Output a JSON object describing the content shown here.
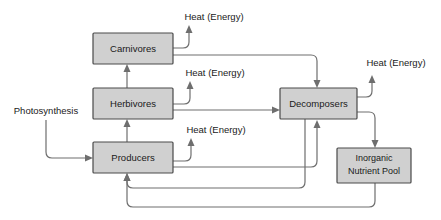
{
  "diagram": {
    "background_color": "#ffffff",
    "box_fill_color": "#d0d0d0",
    "box_border_color": "#4a4a4a",
    "line_color": "#6e6e6e",
    "text_color": "#1a1a1a",
    "nodes": [
      {
        "id": "carnivores",
        "label": "Carnivores",
        "x": 93,
        "y": 33,
        "w": 80,
        "h": 31
      },
      {
        "id": "herbivores",
        "label": "Herbivores",
        "x": 93,
        "y": 88,
        "w": 80,
        "h": 31
      },
      {
        "id": "producers",
        "label": "Producers",
        "x": 93,
        "y": 142,
        "w": 80,
        "h": 31
      },
      {
        "id": "decomposers",
        "label": "Decomposers",
        "x": 280,
        "y": 88,
        "w": 77,
        "h": 31
      },
      {
        "id": "inorganic_nutrient_pool",
        "label_line1": "Inorganic",
        "label_line2": "Nutrient Pool",
        "x": 337,
        "y": 148,
        "w": 74,
        "h": 35
      }
    ],
    "free_labels": [
      {
        "id": "photosynthesis",
        "text": "Photosynthesis",
        "x": 46,
        "y": 111
      },
      {
        "id": "heat-carnivores",
        "text": "Heat (Energy)",
        "x": 214,
        "y": 17
      },
      {
        "id": "heat-herbivores",
        "text": "Heat (Energy)",
        "x": 215,
        "y": 73
      },
      {
        "id": "heat-producers",
        "text": "Heat (Energy)",
        "x": 216,
        "y": 130
      },
      {
        "id": "heat-decomposers",
        "text": "Heat (Energy)",
        "x": 396,
        "y": 63
      }
    ],
    "flows": [
      {
        "id": "photosynthesis-to-producers",
        "from": "photosynthesis",
        "to": "producers"
      },
      {
        "id": "producers-to-herbivores",
        "from": "producers",
        "to": "herbivores"
      },
      {
        "id": "herbivores-to-carnivores",
        "from": "herbivores",
        "to": "carnivores"
      },
      {
        "id": "carnivores-heat-out",
        "from": "carnivores",
        "to": "heat-carnivores"
      },
      {
        "id": "herbivores-heat-out",
        "from": "herbivores",
        "to": "heat-herbivores"
      },
      {
        "id": "producers-heat-out",
        "from": "producers",
        "to": "heat-producers"
      },
      {
        "id": "decomposers-heat-out",
        "from": "decomposers",
        "to": "heat-decomposers"
      },
      {
        "id": "carnivores-to-decomposers",
        "from": "carnivores",
        "to": "decomposers"
      },
      {
        "id": "herbivores-to-decomposers",
        "from": "herbivores",
        "to": "decomposers"
      },
      {
        "id": "producers-to-decomposers",
        "from": "producers",
        "to": "decomposers"
      },
      {
        "id": "decomposers-to-nutrient-pool",
        "from": "decomposers",
        "to": "inorganic_nutrient_pool"
      },
      {
        "id": "decomposers-to-producers",
        "from": "decomposers",
        "to": "producers"
      },
      {
        "id": "nutrient-pool-to-producers",
        "from": "inorganic_nutrient_pool",
        "to": "producers"
      }
    ]
  }
}
